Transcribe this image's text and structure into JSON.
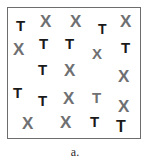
{
  "figure": {
    "caption": "a.",
    "border_color": "#6d6d6d",
    "background_color": "#ffffff",
    "target_color": "#1a1a1a",
    "distractor_color": "#6f7072",
    "box": {
      "x": 7,
      "y": 7,
      "width": 134,
      "height": 132
    }
  },
  "stimulus": {
    "target_letter": "T",
    "distractor_letter": "X",
    "item_count": 24,
    "items": [
      {
        "char": "T",
        "color": "#1a1a1a",
        "x": 8,
        "y": 10,
        "size": 15
      },
      {
        "char": "X",
        "color": "#6f7072",
        "x": 32,
        "y": 5,
        "size": 17
      },
      {
        "char": "X",
        "color": "#6f7072",
        "x": 62,
        "y": 5,
        "size": 17
      },
      {
        "char": "T",
        "color": "#1a1a1a",
        "x": 90,
        "y": 14,
        "size": 14
      },
      {
        "char": "X",
        "color": "#6f7072",
        "x": 112,
        "y": 5,
        "size": 17
      },
      {
        "char": "X",
        "color": "#6f7072",
        "x": 5,
        "y": 33,
        "size": 17
      },
      {
        "char": "T",
        "color": "#1a1a1a",
        "x": 31,
        "y": 28,
        "size": 15
      },
      {
        "char": "T",
        "color": "#1a1a1a",
        "x": 57,
        "y": 28,
        "size": 15
      },
      {
        "char": "X",
        "color": "#6f7072",
        "x": 84,
        "y": 38,
        "size": 15
      },
      {
        "char": "T",
        "color": "#1a1a1a",
        "x": 113,
        "y": 32,
        "size": 15
      },
      {
        "char": "T",
        "color": "#1a1a1a",
        "x": 30,
        "y": 54,
        "size": 15
      },
      {
        "char": "X",
        "color": "#6f7072",
        "x": 56,
        "y": 54,
        "size": 17
      },
      {
        "char": "X",
        "color": "#6f7072",
        "x": 110,
        "y": 60,
        "size": 17
      },
      {
        "char": "T",
        "color": "#1a1a1a",
        "x": 5,
        "y": 77,
        "size": 15
      },
      {
        "char": "T",
        "color": "#1a1a1a",
        "x": 30,
        "y": 85,
        "size": 15
      },
      {
        "char": "X",
        "color": "#6f7072",
        "x": 55,
        "y": 82,
        "size": 17
      },
      {
        "char": "T",
        "color": "#6f7072",
        "x": 84,
        "y": 82,
        "size": 15
      },
      {
        "char": "X",
        "color": "#6f7072",
        "x": 110,
        "y": 90,
        "size": 17
      },
      {
        "char": "X",
        "color": "#6f7072",
        "x": 14,
        "y": 107,
        "size": 17
      },
      {
        "char": "X",
        "color": "#6f7072",
        "x": 52,
        "y": 106,
        "size": 17
      },
      {
        "char": "T",
        "color": "#1a1a1a",
        "x": 82,
        "y": 106,
        "size": 15
      },
      {
        "char": "T",
        "color": "#1a1a1a",
        "x": 108,
        "y": 111,
        "size": 16
      }
    ]
  }
}
